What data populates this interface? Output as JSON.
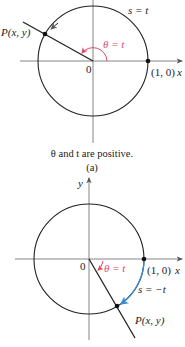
{
  "figure_a": {
    "point_label": "P(x, y)",
    "arc_label": "s = t",
    "angle_label": "θ = t",
    "origin_label": "0",
    "unit_point_label": "(1, 0)",
    "x_axis_label": "x",
    "caption": "θ and t are positive.",
    "sublabel": "(a)"
  },
  "figure_b": {
    "point_label": "P(x, y)",
    "arc_label": "s = −t",
    "angle_label": "θ = t",
    "origin_label": "0",
    "unit_point_label": "(1, 0)",
    "x_axis_label": "x",
    "y_axis_label": "y"
  },
  "colors": {
    "angle_arc": "#e04a6a",
    "arc_length": "#3a8ad0",
    "stroke": "#222222"
  }
}
